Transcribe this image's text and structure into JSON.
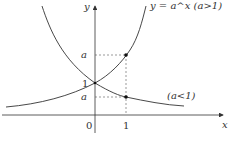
{
  "diagram": {
    "axes": {
      "x_label": "x",
      "y_label": "y",
      "origin_label": "0"
    },
    "ticks": {
      "x_one": "1",
      "y_one": "1"
    },
    "level_labels": {
      "upper_a": "a",
      "lower_a": "a"
    },
    "curves": [
      {
        "name": "growth",
        "label": "y = a^x  (a>1)"
      },
      {
        "name": "decay",
        "label": "(a<1)"
      }
    ],
    "points": [
      {
        "name": "point-growth-at-1",
        "x": 1,
        "y": "a"
      },
      {
        "name": "point-decay-at-1",
        "x": 1,
        "y": "a"
      },
      {
        "name": "intersection",
        "x": 0,
        "y": 1
      }
    ],
    "colors": {
      "curve": "#333333",
      "axis": "#333333",
      "guide": "#555555"
    }
  }
}
